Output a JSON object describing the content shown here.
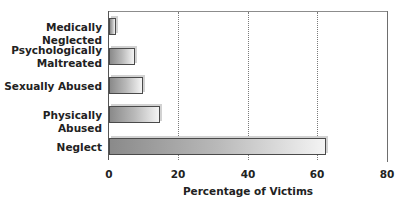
{
  "chart_data": {
    "type": "bar",
    "orientation": "horizontal",
    "title": "",
    "xlabel": "Percentage of Victims",
    "ylabel": "",
    "categories": [
      "Medically Neglected",
      "Psychologically\nMaltreated",
      "Sexually Abused",
      "Physically Abused",
      "Neglect"
    ],
    "values": [
      2,
      7.5,
      9.8,
      14.7,
      62.5
    ],
    "xlim": [
      0,
      80
    ],
    "x_ticks": [
      "0",
      "20",
      "40",
      "60",
      "80"
    ],
    "grid": {
      "vertical": true,
      "style": "dotted",
      "positions": [
        20,
        40,
        60
      ]
    },
    "legend": null,
    "bar_fill": {
      "gradient_from": "#8a8a8a",
      "gradient_to": "#f4f4f4",
      "border": "#4a4a4a"
    }
  },
  "labels": {
    "cat0": "Medically Neglected",
    "cat1": "Psychologically\nMaltreated",
    "cat2": "Sexually Abused",
    "cat3": "Physically Abused",
    "cat4": "Neglect",
    "tick0": "0",
    "tick1": "20",
    "tick2": "40",
    "tick3": "60",
    "tick4": "80",
    "xtitle": "Percentage of Victims"
  }
}
